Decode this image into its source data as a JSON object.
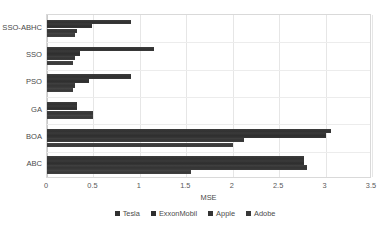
{
  "chart_data": {
    "type": "bar",
    "orientation": "horizontal",
    "title": "",
    "xlabel": "MSE",
    "ylabel": "",
    "xlim": [
      0,
      3.5
    ],
    "xticks": [
      "0",
      "0.5",
      "1",
      "1.5",
      "2",
      "2.5",
      "3",
      "3.5"
    ],
    "xtick_values": [
      0,
      0.5,
      1,
      1.5,
      2,
      2.5,
      3,
      3.5
    ],
    "grid": "vertical",
    "legend_position": "bottom",
    "categories": [
      "SSO-ABHC",
      "SSO",
      "PSO",
      "GA",
      "BOA",
      "ABC"
    ],
    "series": [
      {
        "name": "Tesla",
        "color": "#313131",
        "values": [
          0.9,
          1.15,
          0.9,
          0.32,
          3.06,
          2.77
        ]
      },
      {
        "name": "ExxonMobil",
        "color": "#2e2e2e",
        "values": [
          0.48,
          0.36,
          0.45,
          0.32,
          3.0,
          2.77
        ]
      },
      {
        "name": "Apple",
        "color": "#343434",
        "values": [
          0.32,
          0.3,
          0.3,
          0.5,
          2.12,
          2.8
        ]
      },
      {
        "name": "Adobe",
        "color": "#383838",
        "values": [
          0.3,
          0.28,
          0.28,
          0.5,
          2.0,
          1.55
        ]
      }
    ]
  },
  "legend": {
    "items": [
      {
        "label": "Tesla"
      },
      {
        "label": "ExxonMobil"
      },
      {
        "label": "Apple"
      },
      {
        "label": "Adobe"
      }
    ]
  },
  "axis": {
    "x_title": "MSE"
  }
}
